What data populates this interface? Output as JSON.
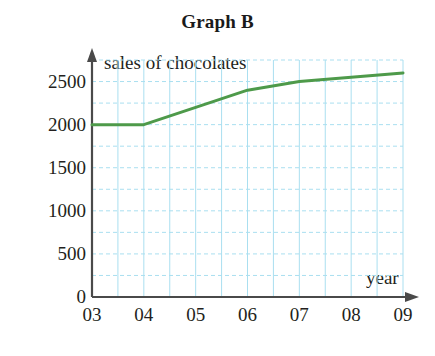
{
  "chart_data": {
    "type": "line",
    "title": "Graph B",
    "xlabel": "year",
    "ylabel": "sales of chocolates",
    "categories": [
      "03",
      "04",
      "05",
      "06",
      "07",
      "08",
      "09"
    ],
    "x": [
      3,
      4,
      5,
      6,
      7,
      8,
      9
    ],
    "values": [
      2000,
      2000,
      2200,
      2400,
      2500,
      2550,
      2600
    ],
    "series": [
      {
        "name": "sales of chocolates",
        "values": [
          2000,
          2000,
          2200,
          2400,
          2500,
          2550,
          2600
        ]
      }
    ],
    "xlim": [
      3,
      9
    ],
    "ylim": [
      0,
      2750
    ],
    "y_ticks": [
      0,
      500,
      1000,
      1500,
      2000,
      2500
    ],
    "y_tick_labels": [
      "0",
      "500",
      "1000",
      "1500",
      "2000",
      "2500"
    ],
    "x_ticks": [
      3,
      4,
      5,
      6,
      7,
      8,
      9
    ],
    "x_tick_labels": [
      "03",
      "04",
      "05",
      "06",
      "07",
      "08",
      "09"
    ],
    "grid": true,
    "grid_color": "#aadff0",
    "grid_y_step": 250,
    "grid_x_step": 0.5,
    "line_color": "#4e9a4a",
    "axis_color": "#4a4a4a",
    "legend": "none",
    "legend_position": "none"
  },
  "axes": {
    "y_arrow": "up-arrow-icon",
    "x_arrow": "right-arrow-icon"
  }
}
